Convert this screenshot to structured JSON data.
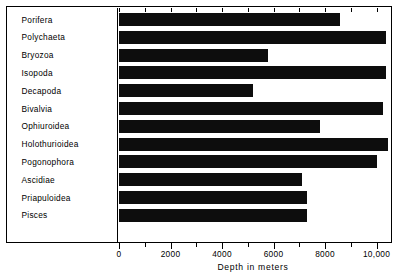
{
  "chart_data": {
    "type": "bar",
    "orientation": "horizontal",
    "title": "",
    "xlabel": "Depth in meters",
    "ylabel": "",
    "xlim": [
      0,
      10600
    ],
    "grid": false,
    "legend": null,
    "categories": [
      "Porifera",
      "Polychaeta",
      "Bryozoa",
      "Isopoda",
      "Decapoda",
      "Bivalvia",
      "Ophiuroidea",
      "Holothurioidea",
      "Pogonophora",
      "Ascidiae",
      "Priapuloidea",
      "Pisces"
    ],
    "values": [
      8600,
      10350,
      5800,
      10350,
      5200,
      10250,
      7800,
      10450,
      10000,
      7100,
      7300,
      7300
    ],
    "tick_values": [
      0,
      2000,
      4000,
      6000,
      8000,
      10000
    ],
    "tick_labels": [
      "0",
      "2000",
      "4000",
      "6000",
      "8000",
      "10,000"
    ],
    "minor_tick_step": 1000,
    "bar_color": "#0d0d0d",
    "background_color": "#ffffff"
  }
}
